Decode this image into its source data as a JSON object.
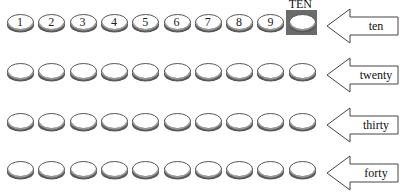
{
  "title_box_label": "TEN",
  "rows": [
    {
      "label": "ten",
      "coins": [
        "1",
        "2",
        "3",
        "4",
        "5",
        "6",
        "7",
        "8",
        "9",
        ""
      ],
      "highlight_last": true
    },
    {
      "label": "twenty",
      "coins": [
        "",
        "",
        "",
        "",
        "",
        "",
        "",
        "",
        "",
        ""
      ],
      "highlight_last": false
    },
    {
      "label": "thirty",
      "coins": [
        "",
        "",
        "",
        "",
        "",
        "",
        "",
        "",
        "",
        ""
      ],
      "highlight_last": false
    },
    {
      "label": "forty",
      "coins": [
        "",
        "",
        "",
        "",
        "",
        "",
        "",
        "",
        "",
        ""
      ],
      "highlight_last": false
    }
  ],
  "colors": {
    "coin_rim": "#555555",
    "coin_face": "#ffffff",
    "highlight_box": "#6b6b6b",
    "arrow_stroke": "#444444"
  }
}
